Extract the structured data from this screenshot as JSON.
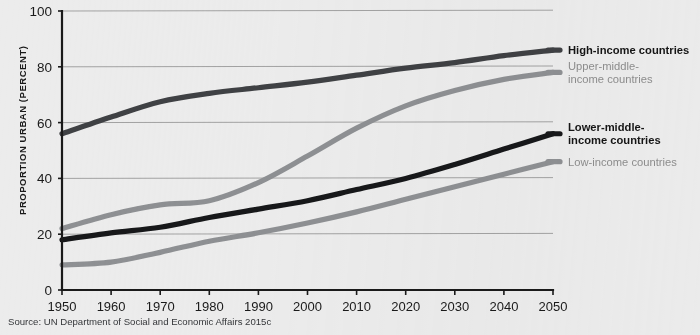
{
  "chart_data": {
    "type": "line",
    "title": "",
    "xlabel": "",
    "ylabel": "PROPORTION URBAN (PERCENT)",
    "xlim": [
      1950,
      2050
    ],
    "ylim": [
      0,
      100
    ],
    "grid": true,
    "legend_position": "right",
    "x": [
      1950,
      1960,
      1970,
      1980,
      1990,
      2000,
      2010,
      2020,
      2030,
      2040,
      2050
    ],
    "xtick_labels": [
      "1950",
      "1960",
      "1970",
      "1980",
      "1990",
      "2000",
      "2010",
      "2020",
      "2030",
      "2040",
      "2050"
    ],
    "ytick_labels": [
      "0",
      "20",
      "40",
      "60",
      "80",
      "100"
    ],
    "yticks": [
      0,
      20,
      40,
      60,
      80,
      100
    ],
    "series": [
      {
        "name": "High-income countries",
        "color": "#3f4144",
        "values": [
          56.0,
          62.0,
          67.5,
          70.5,
          72.5,
          74.5,
          77.0,
          79.5,
          81.5,
          84.0,
          86.0
        ]
      },
      {
        "name": "Upper-middle-income countries",
        "color": "#8e9093",
        "values": [
          22.0,
          27.0,
          30.5,
          32.0,
          38.5,
          48.0,
          58.0,
          66.0,
          71.5,
          75.5,
          78.0
        ]
      },
      {
        "name": "Lower-middle-income countries",
        "color": "#17181a",
        "values": [
          18.0,
          20.5,
          22.5,
          26.0,
          29.0,
          32.0,
          36.0,
          40.0,
          45.0,
          50.5,
          56.0
        ]
      },
      {
        "name": "Low-income countries",
        "color": "#8e9093",
        "values": [
          9.0,
          10.0,
          13.5,
          17.5,
          20.5,
          24.0,
          28.0,
          32.5,
          37.0,
          41.5,
          46.0
        ]
      }
    ]
  },
  "legend": {
    "entries": [
      {
        "label_lines": [
          "High-income countries"
        ],
        "style": "strong",
        "color": "#3f4144"
      },
      {
        "label_lines": [
          "Upper-middle-",
          "income countries"
        ],
        "style": "muted",
        "color": "#8e9093"
      },
      {
        "label_lines": [
          "Lower-middle-",
          "income countries"
        ],
        "style": "strong",
        "color": "#17181a"
      },
      {
        "label_lines": [
          "Low-income countries"
        ],
        "style": "muted",
        "color": "#8e9093"
      }
    ],
    "line_1": "High-income countries",
    "line_2a": "Upper-middle-",
    "line_2b": "income countries",
    "line_3a": "Lower-middle-",
    "line_3b": "income countries",
    "line_4": "Low-income countries"
  },
  "axis": {
    "y_title": "PROPORTION URBAN (PERCENT)",
    "y_0": "0",
    "y_20": "20",
    "y_40": "40",
    "y_60": "60",
    "y_80": "80",
    "y_100": "100",
    "x_1950": "1950",
    "x_1960": "1960",
    "x_1970": "1970",
    "x_1980": "1980",
    "x_1990": "1990",
    "x_2000": "2000",
    "x_2010": "2010",
    "x_2020": "2020",
    "x_2030": "2030",
    "x_2040": "2040",
    "x_2050": "2050"
  },
  "footer": {
    "source": "Source: UN Department of Social and Economic Affairs 2015c"
  },
  "colors": {
    "background": "#ececec",
    "axis": "#1a1a1a",
    "grid": "#9a9a9a",
    "dark_series": "#17181a",
    "mid_dark_series": "#3f4144",
    "gray_series": "#8e9093"
  }
}
